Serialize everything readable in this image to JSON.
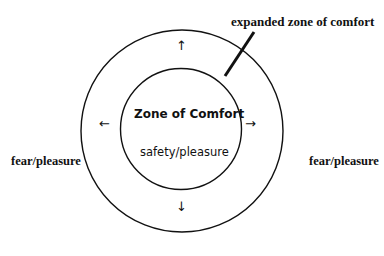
{
  "diagram": {
    "outer_label": "expanded zone of comfort",
    "inner_title": "Zone of Comfort",
    "inner_subtitle": "safety/pleasure",
    "left_label": "fear/pleasure",
    "right_label": "fear/pleasure",
    "arrows": {
      "up": "↑",
      "down": "↓",
      "left": "←",
      "right": "→"
    }
  }
}
